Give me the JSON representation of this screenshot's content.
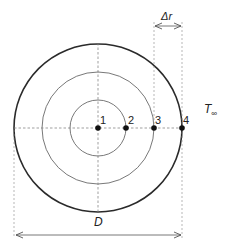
{
  "diagram": {
    "title": "",
    "colors": {
      "outer_circle": "#2a2a2a",
      "inner_circles": "#555555",
      "dashed_lines": "#777777",
      "nodes": "#111111",
      "text": "#222222",
      "background": "#ffffff"
    },
    "geometry": {
      "center": [
        98,
        128
      ],
      "outer_radius": 84,
      "middle_radius": 56,
      "inner_radius": 28
    },
    "nodes": [
      {
        "id": "1",
        "label": "1",
        "x": 98,
        "y": 128
      },
      {
        "id": "2",
        "label": "2",
        "x": 126,
        "y": 128
      },
      {
        "id": "3",
        "label": "3",
        "x": 154,
        "y": 128
      },
      {
        "id": "4",
        "label": "4",
        "x": 182,
        "y": 128
      }
    ],
    "labels": {
      "delta_r": "Δr",
      "ambient_temperature": "T",
      "ambient_subscript": "∞",
      "diameter": "D"
    }
  }
}
